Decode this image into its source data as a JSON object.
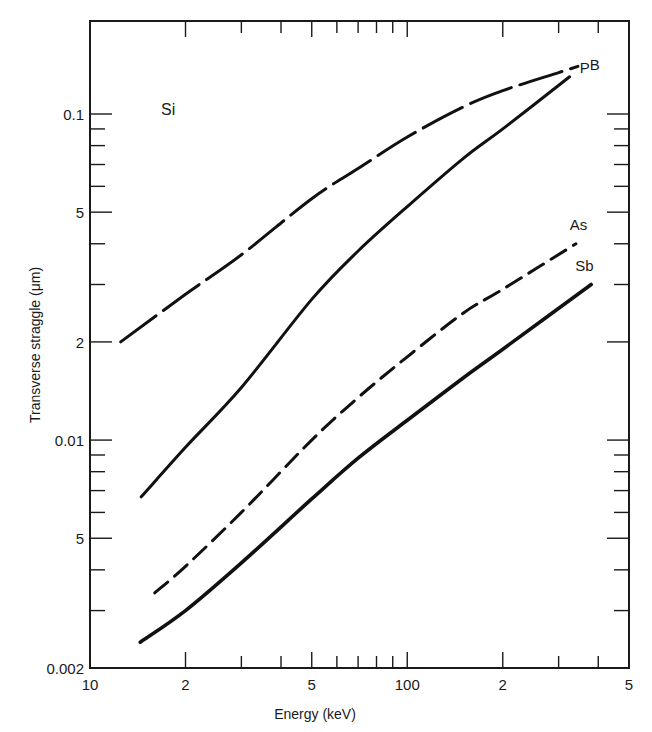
{
  "chart_data": {
    "type": "line",
    "title": "",
    "annotation": "Si",
    "xlabel": "Energy (keV)",
    "ylabel": "Transverse straggle (μm)",
    "xscale": "log",
    "yscale": "log",
    "xlim": [
      10,
      500
    ],
    "ylim": [
      0.002,
      0.19
    ],
    "grid": false,
    "legend_position": "inline labels at curve ends",
    "x_ticks": {
      "labeled": [
        {
          "value": 10,
          "label": "10"
        },
        {
          "value": 20,
          "label": "2"
        },
        {
          "value": 50,
          "label": "5"
        },
        {
          "value": 100,
          "label": "100"
        },
        {
          "value": 200,
          "label": "2"
        },
        {
          "value": 500,
          "label": "5"
        }
      ],
      "minor": [
        30,
        40,
        60,
        70,
        80,
        90,
        300,
        400
      ]
    },
    "y_ticks": {
      "labeled": [
        {
          "value": 0.1,
          "label": "0.1"
        },
        {
          "value": 0.05,
          "label": "5"
        },
        {
          "value": 0.02,
          "label": "2"
        },
        {
          "value": 0.01,
          "label": "0.01"
        },
        {
          "value": 0.005,
          "label": "5"
        },
        {
          "value": 0.002,
          "label": "0.002"
        }
      ],
      "minor": [
        0.09,
        0.08,
        0.07,
        0.06,
        0.04,
        0.03,
        0.009,
        0.008,
        0.007,
        0.006,
        0.004,
        0.003
      ]
    },
    "series": [
      {
        "name": "B",
        "style": "long-dash",
        "x": [
          12.5,
          20,
          30,
          50,
          70,
          100,
          150,
          200,
          300,
          345
        ],
        "y": [
          0.02,
          0.028,
          0.037,
          0.055,
          0.068,
          0.085,
          0.105,
          0.118,
          0.134,
          0.14
        ]
      },
      {
        "name": "P",
        "style": "solid",
        "x": [
          14.5,
          20,
          30,
          50,
          70,
          100,
          150,
          200,
          325
        ],
        "y": [
          0.0067,
          0.0095,
          0.0145,
          0.027,
          0.038,
          0.052,
          0.073,
          0.09,
          0.13
        ]
      },
      {
        "name": "As",
        "style": "dash",
        "x": [
          16,
          20,
          30,
          50,
          70,
          100,
          150,
          200,
          340
        ],
        "y": [
          0.0034,
          0.0041,
          0.006,
          0.01,
          0.0135,
          0.018,
          0.0245,
          0.029,
          0.04
        ]
      },
      {
        "name": "Sb",
        "style": "solid-thick",
        "x": [
          14.4,
          20,
          30,
          50,
          70,
          100,
          150,
          200,
          380
        ],
        "y": [
          0.0024,
          0.003,
          0.0042,
          0.0066,
          0.0088,
          0.0115,
          0.0155,
          0.019,
          0.03
        ]
      }
    ]
  }
}
